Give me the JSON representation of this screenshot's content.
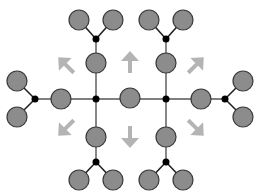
{
  "diagram": {
    "title": "",
    "colors": {
      "background": "#ffffff",
      "node_fill": "#8c8c8c",
      "node_stroke": "#3a3a3a",
      "junction_fill": "#000000",
      "edge": "#555555",
      "fork_edge": "#222222",
      "arrow": "#b4b4b4"
    },
    "node_radius": 10,
    "junction_radius": 3.5,
    "nodes": [
      {
        "id": "center",
        "x": 130,
        "y": 98
      },
      {
        "id": "left",
        "x": 61,
        "y": 99
      },
      {
        "id": "right",
        "x": 201,
        "y": 99
      },
      {
        "id": "left-leaf-top",
        "x": 17,
        "y": 81
      },
      {
        "id": "left-leaf-bottom",
        "x": 17,
        "y": 117
      },
      {
        "id": "right-leaf-top",
        "x": 243,
        "y": 81
      },
      {
        "id": "right-leaf-bottom",
        "x": 243,
        "y": 117
      },
      {
        "id": "top-left",
        "x": 96,
        "y": 63
      },
      {
        "id": "top-left-leaf-a",
        "x": 79,
        "y": 20
      },
      {
        "id": "top-left-leaf-b",
        "x": 113,
        "y": 20
      },
      {
        "id": "top-right",
        "x": 166,
        "y": 63
      },
      {
        "id": "top-right-leaf-a",
        "x": 149,
        "y": 20
      },
      {
        "id": "top-right-leaf-b",
        "x": 183,
        "y": 20
      },
      {
        "id": "bottom-left",
        "x": 96,
        "y": 137
      },
      {
        "id": "bottom-left-leaf-a",
        "x": 79,
        "y": 180
      },
      {
        "id": "bottom-left-leaf-b",
        "x": 113,
        "y": 180
      },
      {
        "id": "bottom-right",
        "x": 166,
        "y": 137
      },
      {
        "id": "bottom-right-leaf-a",
        "x": 149,
        "y": 180
      },
      {
        "id": "bottom-right-leaf-b",
        "x": 183,
        "y": 180
      }
    ],
    "junctions": [
      {
        "id": "j-left-center",
        "x": 96,
        "y": 99
      },
      {
        "id": "j-right-center",
        "x": 166,
        "y": 99
      },
      {
        "id": "j-left-fork",
        "x": 35,
        "y": 99
      },
      {
        "id": "j-right-fork",
        "x": 225,
        "y": 99
      },
      {
        "id": "j-top-left",
        "x": 96,
        "y": 39
      },
      {
        "id": "j-top-right",
        "x": 166,
        "y": 39
      },
      {
        "id": "j-bottom-left",
        "x": 96,
        "y": 162
      },
      {
        "id": "j-bottom-right",
        "x": 166,
        "y": 162
      }
    ],
    "edges": [
      {
        "x1": 35,
        "y1": 99,
        "x2": 225,
        "y2": 99,
        "type": "main"
      },
      {
        "x1": 96,
        "y1": 39,
        "x2": 96,
        "y2": 162,
        "type": "main"
      },
      {
        "x1": 166,
        "y1": 39,
        "x2": 166,
        "y2": 162,
        "type": "main"
      },
      {
        "x1": 35,
        "y1": 99,
        "x2": 17,
        "y2": 81,
        "type": "fork"
      },
      {
        "x1": 35,
        "y1": 99,
        "x2": 17,
        "y2": 117,
        "type": "fork"
      },
      {
        "x1": 225,
        "y1": 99,
        "x2": 243,
        "y2": 81,
        "type": "fork"
      },
      {
        "x1": 225,
        "y1": 99,
        "x2": 243,
        "y2": 117,
        "type": "fork"
      },
      {
        "x1": 96,
        "y1": 39,
        "x2": 79,
        "y2": 20,
        "type": "fork"
      },
      {
        "x1": 96,
        "y1": 39,
        "x2": 113,
        "y2": 20,
        "type": "fork"
      },
      {
        "x1": 166,
        "y1": 39,
        "x2": 149,
        "y2": 20,
        "type": "fork"
      },
      {
        "x1": 166,
        "y1": 39,
        "x2": 183,
        "y2": 20,
        "type": "fork"
      },
      {
        "x1": 96,
        "y1": 162,
        "x2": 79,
        "y2": 180,
        "type": "fork"
      },
      {
        "x1": 96,
        "y1": 162,
        "x2": 113,
        "y2": 180,
        "type": "fork"
      },
      {
        "x1": 166,
        "y1": 162,
        "x2": 149,
        "y2": 180,
        "type": "fork"
      },
      {
        "x1": 166,
        "y1": 162,
        "x2": 183,
        "y2": 180,
        "type": "fork"
      }
    ],
    "arrows": [
      {
        "id": "arrow-up",
        "direction": "up",
        "cx": 130,
        "cy": 62,
        "rotation": 0
      },
      {
        "id": "arrow-down",
        "direction": "down",
        "cx": 130,
        "cy": 137,
        "rotation": 180
      },
      {
        "id": "arrow-up-left",
        "direction": "up-left",
        "cx": 66,
        "cy": 65,
        "rotation": -45
      },
      {
        "id": "arrow-up-right",
        "direction": "up-right",
        "cx": 196,
        "cy": 65,
        "rotation": 45
      },
      {
        "id": "arrow-down-left",
        "direction": "down-left",
        "cx": 66,
        "cy": 128,
        "rotation": -135
      },
      {
        "id": "arrow-down-right",
        "direction": "down-right",
        "cx": 196,
        "cy": 128,
        "rotation": 135
      }
    ]
  }
}
